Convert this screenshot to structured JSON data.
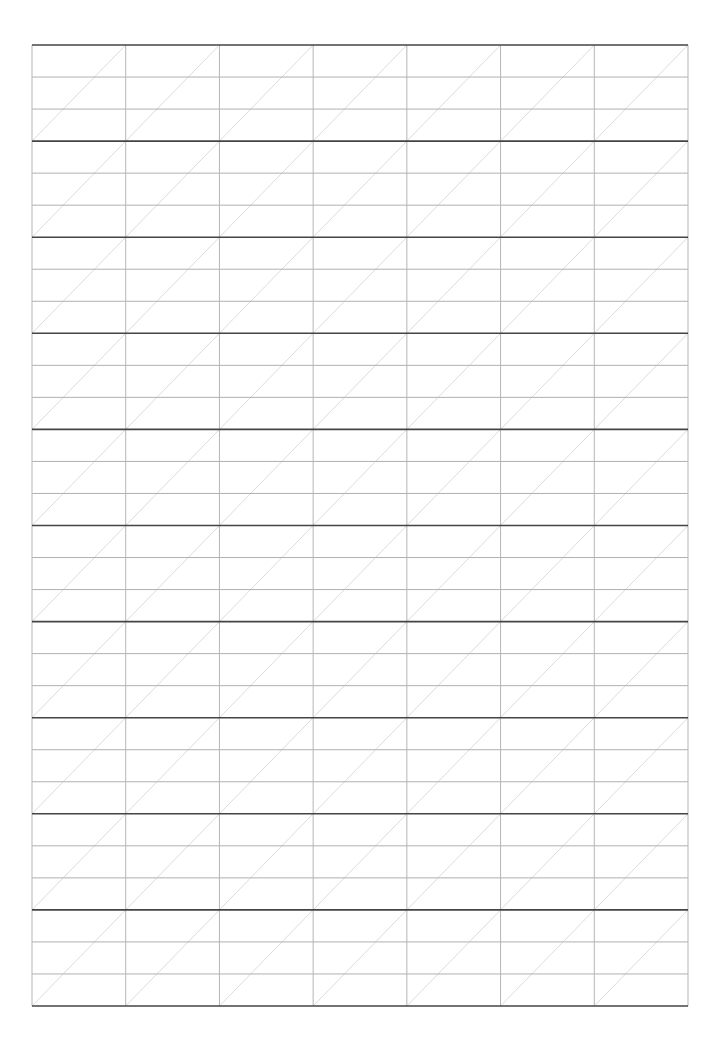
{
  "page": {
    "type": "handwriting-practice-grid",
    "width": 723,
    "height": 1042
  },
  "grid": {
    "left": 32,
    "top": 45,
    "right": 688,
    "bottom": 1006,
    "columns": 7,
    "blocks": 10,
    "lines_per_block": 3,
    "diagonal": "bottom-left-to-top-right",
    "colors": {
      "thick_line": "#444444",
      "thin_line": "#b0b0b0",
      "vertical_line": "#b5b5b5",
      "diagonal": "#dcdcdc"
    }
  }
}
